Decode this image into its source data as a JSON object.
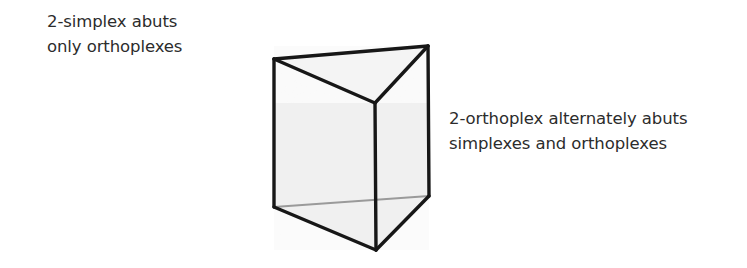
{
  "figure": {
    "background_color": "#ffffff",
    "title": "",
    "shape": {
      "name": "triangular-prism",
      "description": "Triangular prism drawn in oblique projection with top triangular face visible",
      "face_fill_color": "#f0f0f0",
      "top_face_fill_color": "#f4f4f4",
      "edge_color": "#171717",
      "hidden_edge_color": "#9a9a9a",
      "edge_width": 3,
      "hidden_edge_width": 2,
      "vertices": {
        "top_back_left": [
          274,
          59
        ],
        "top_back_right": [
          428,
          46
        ],
        "top_front": [
          375,
          103
        ],
        "bottom_back_left": [
          274,
          207
        ],
        "bottom_back_right": [
          429,
          196
        ],
        "bottom_front": [
          376,
          250
        ]
      }
    }
  },
  "annotations": {
    "left": {
      "name": "simplex-annotation",
      "lines": [
        "2-simplex abuts",
        "only orthoplexes"
      ],
      "color": "#2c2c2c"
    },
    "right": {
      "name": "orthoplex-annotation",
      "lines": [
        "2-orthoplex alternately abuts",
        "simplexes and orthoplexes"
      ],
      "color": "#2c2c2c"
    }
  }
}
